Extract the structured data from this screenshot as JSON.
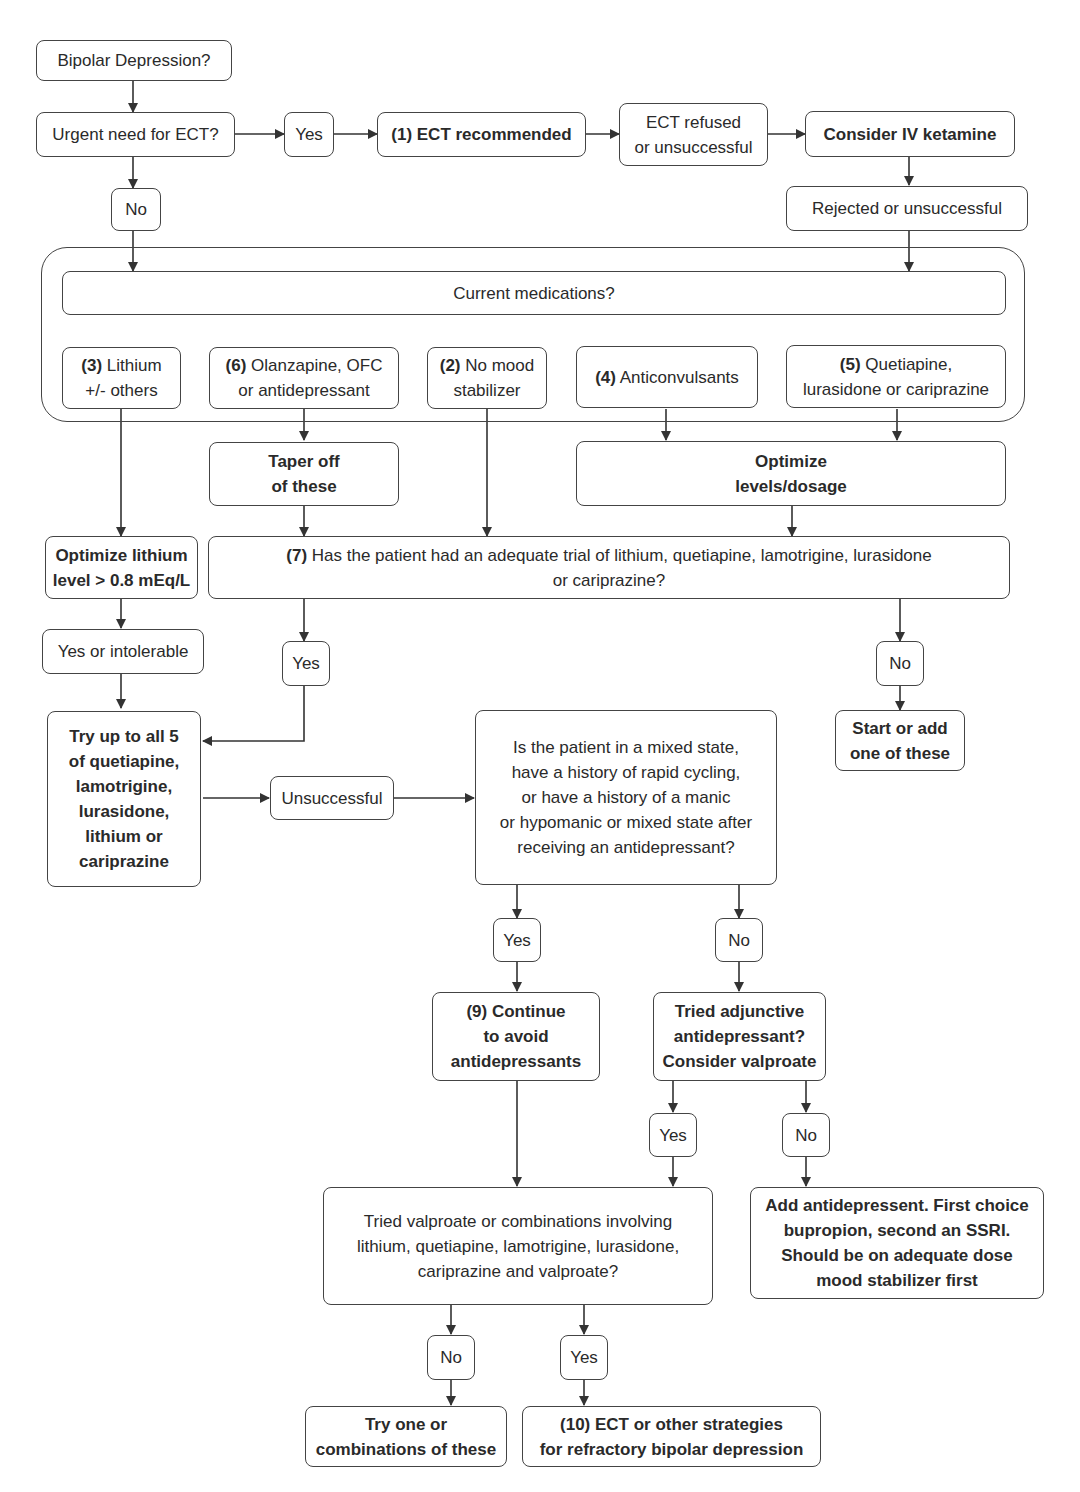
{
  "diagram": {
    "nodes": {
      "start": "Bipolar Depression?",
      "urgent_ect": "Urgent need for ECT?",
      "yes_urgent": "Yes",
      "no_urgent": "No",
      "ect_recommended": "(1) ECT recommended",
      "ect_refused": "ECT refused\nor unsuccessful",
      "iv_ketamine": "Consider IV ketamine",
      "ketamine_rejected": "Rejected or unsuccessful",
      "current_meds": "Current medications?",
      "lithium": {
        "num": "(3)",
        "text": " Lithium\n+/- others"
      },
      "olanzapine": {
        "num": "(6)",
        "text": " Olanzapine, OFC\nor antidepressant"
      },
      "no_mood_stabilizer": {
        "num": "(2)",
        "text": " No mood\nstabilizer"
      },
      "anticonvulsants": {
        "num": "(4)",
        "text": " Anticonvulsants"
      },
      "quetiapine": {
        "num": "(5)",
        "text": " Quetiapine,\nlurasidone or cariprazine"
      },
      "taper_off": "Taper off\nof these",
      "optimize_levels": "Optimize\nlevels/dosage",
      "optimize_lithium": "Optimize lithium\nlevel > 0.8 mEq/L",
      "adequate_trial": {
        "num": "(7)",
        "text": " Has the patient had an adequate trial of lithium, quetiapine, lamotrigine, lurasidone\nor cariprazine?"
      },
      "yes_or_intolerable": "Yes or intolerable",
      "yes_trial": "Yes",
      "no_trial": "No",
      "start_or_add": "Start or add\none of these",
      "try_all_5": "Try up to all 5\nof quetiapine,\nlamotrigine,\nlurasidone,\nlithium or\ncariprazine",
      "unsuccessful": "Unsuccessful",
      "mixed_state": "Is the patient in a mixed state,\nhave a history of rapid cycling,\nor have a history of a manic\nor hypomanic or mixed state after\nreceiving an antidepressant?",
      "yes_mixed": "Yes",
      "no_mixed": "No",
      "continue_avoid": "(9) Continue\nto avoid\nantidepressants",
      "tried_adjunctive": "Tried adjunctive\nantidepressant?\nConsider valproate",
      "yes_adjunctive": "Yes",
      "no_adjunctive": "No",
      "add_antidepressant": "Add antidepressent. First choice\nbupropion, second an SSRI.\nShould be on adequate dose\nmood stabilizer first",
      "tried_valproate": "Tried valproate or combinations involving\nlithium, quetiapine, lamotrigine, lurasidone,\ncariprazine and valproate?",
      "no_valproate": "No",
      "yes_valproate": "Yes",
      "try_combinations": "Try one or\ncombinations of these",
      "ect_refractory": "(10) ECT or other strategies\nfor refractory bipolar depression"
    },
    "colors": {
      "stroke": "#444444",
      "text": "#2a2a2a",
      "background": "#ffffff"
    }
  }
}
